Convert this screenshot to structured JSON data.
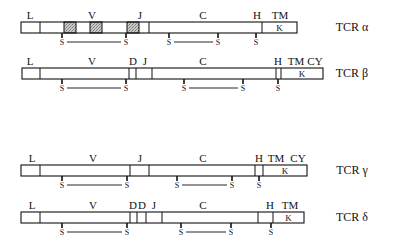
{
  "diagram": {
    "rows": [
      {
        "name": "TCR α",
        "y": 22,
        "x0": 21,
        "x1": 297,
        "dividers": [
          40,
          149,
          262,
          252
        ],
        "shaded": [
          [
            64,
            76
          ],
          [
            90,
            102
          ],
          [
            127,
            139
          ]
        ],
        "k_box": {
          "x0": 262,
          "x1": 297,
          "label": "K"
        },
        "labels": [
          {
            "text": "L",
            "x": 30
          },
          {
            "text": "V",
            "x": 92
          },
          {
            "text": "J",
            "x": 140
          },
          {
            "text": "C",
            "x": 203
          },
          {
            "text": "H",
            "x": 257
          },
          {
            "text": "TM",
            "x": 280
          }
        ],
        "s_marks": [
          62,
          126,
          169,
          218,
          256
        ],
        "bridges": [
          [
            62,
            126
          ],
          [
            169,
            218
          ]
        ]
      },
      {
        "name": "TCR β",
        "y": 68,
        "x0": 22,
        "x1": 323,
        "dividers": [
          40,
          129,
          136,
          152,
          276,
          281
        ],
        "shaded": [],
        "k_box": {
          "x0": 281,
          "x1": 323,
          "label": "K"
        },
        "labels": [
          {
            "text": "L",
            "x": 30
          },
          {
            "text": "V",
            "x": 92
          },
          {
            "text": "D",
            "x": 133
          },
          {
            "text": "J",
            "x": 145
          },
          {
            "text": "C",
            "x": 203
          },
          {
            "text": "H",
            "x": 278
          },
          {
            "text": "TM",
            "x": 296
          },
          {
            "text": "CY",
            "x": 315
          }
        ],
        "s_marks": [
          62,
          126,
          184,
          243,
          278
        ],
        "bridges": [
          [
            62,
            126
          ],
          [
            184,
            243
          ]
        ]
      },
      {
        "name": "TCR γ",
        "y": 165,
        "x0": 21,
        "x1": 307,
        "dividers": [
          40,
          130,
          149,
          255,
          263
        ],
        "shaded": [],
        "k_box": {
          "x0": 263,
          "x1": 307,
          "label": "K"
        },
        "labels": [
          {
            "text": "L",
            "x": 32
          },
          {
            "text": "V",
            "x": 93
          },
          {
            "text": "J",
            "x": 140
          },
          {
            "text": "C",
            "x": 203
          },
          {
            "text": "H",
            "x": 259
          },
          {
            "text": "TM",
            "x": 276
          },
          {
            "text": "CY",
            "x": 298
          }
        ],
        "s_marks": [
          62,
          127,
          177,
          232,
          259
        ],
        "bridges": [
          [
            62,
            127
          ],
          [
            177,
            232
          ]
        ]
      },
      {
        "name": "TCR δ",
        "y": 212,
        "x0": 21,
        "x1": 304,
        "dividers": [
          40,
          130,
          137,
          146,
          162,
          258,
          273
        ],
        "shaded": [],
        "k_box": {
          "x0": 273,
          "x1": 304,
          "label": "K"
        },
        "labels": [
          {
            "text": "L",
            "x": 32
          },
          {
            "text": "V",
            "x": 93
          },
          {
            "text": "D",
            "x": 133
          },
          {
            "text": "D",
            "x": 142
          },
          {
            "text": "J",
            "x": 154
          },
          {
            "text": "C",
            "x": 203
          },
          {
            "text": "H",
            "x": 270
          },
          {
            "text": "TM",
            "x": 290
          }
        ],
        "s_marks": [
          62,
          127,
          181,
          231,
          271
        ],
        "bridges": [
          [
            62,
            127
          ],
          [
            181,
            231
          ]
        ]
      }
    ],
    "s_label": "S",
    "name_x": 352
  }
}
